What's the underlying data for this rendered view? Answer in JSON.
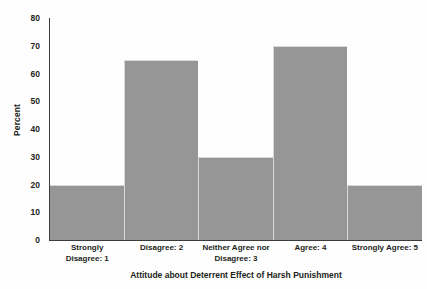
{
  "chart_data": {
    "type": "bar",
    "title": "",
    "xlabel": "Attitude about Deterrent Effect of Harsh Punishment",
    "ylabel": "Percent",
    "categories": [
      "Strongly\nDisagree: 1",
      "Disagree: 2",
      "Neither Agree nor\nDisagree: 3",
      "Agree: 4",
      "Strongly Agree: 5"
    ],
    "values": [
      20,
      65,
      30,
      70,
      20
    ],
    "ylim": [
      0,
      80
    ],
    "yticks": [
      0,
      10,
      20,
      30,
      40,
      50,
      60,
      70,
      80
    ],
    "ytick_labels": [
      "0",
      "10",
      "20",
      "30",
      "40",
      "50",
      "60",
      "70",
      "80"
    ],
    "grid": false,
    "legend": "none",
    "bar_gap": 0,
    "colors": {
      "bar_fill": "#969696",
      "bar_edge": "#d8d8d8",
      "axis": "#3b3b3b",
      "text": "#231f20",
      "background": "#fefefe"
    }
  }
}
